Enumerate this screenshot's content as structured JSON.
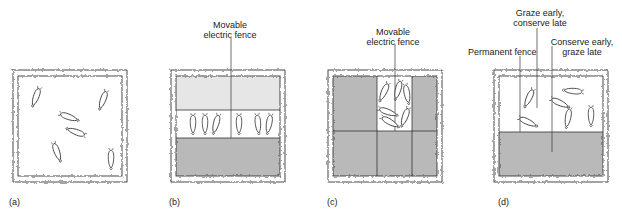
{
  "panels": [
    {
      "id": "a",
      "letter": "(a)",
      "labels": []
    },
    {
      "id": "b",
      "letter": "(b)",
      "labels": [
        {
          "text_line1": "Movable",
          "text_line2": "electric fence"
        }
      ]
    },
    {
      "id": "c",
      "letter": "(c)",
      "labels": [
        {
          "text_line1": "Movable",
          "text_line2": "electric fence"
        }
      ]
    },
    {
      "id": "d",
      "letter": "(d)",
      "labels": [
        {
          "text_line1": "Graze early,",
          "text_line2": "conserve late"
        },
        {
          "text_line1": "Permanent fence"
        },
        {
          "text_line1": "Conserve early,",
          "text_line2": "graze late"
        }
      ]
    }
  ],
  "colors": {
    "dark_shade": "#b9b9b9",
    "light_shade": "#e6e6e6",
    "line": "#333333",
    "white": "#ffffff"
  }
}
